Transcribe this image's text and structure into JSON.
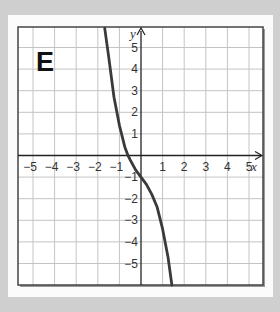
{
  "panel_label": "E",
  "chart_data": {
    "type": "line",
    "title": "E",
    "xlabel": "x",
    "ylabel": "y",
    "xlim": [
      -5.7,
      5.65
    ],
    "ylim": [
      -6,
      5.9
    ],
    "grid": true,
    "x_ticks": [
      "-5",
      "-4",
      "-3",
      "-2",
      "-1",
      "1",
      "2",
      "3",
      "4",
      "5"
    ],
    "y_ticks": [
      "5",
      "4",
      "3",
      "2",
      "1",
      "-1",
      "-2",
      "-3",
      "-4",
      "-5"
    ],
    "series": [
      {
        "name": "curve",
        "color": "#3a3a3a",
        "x": [
          -1.68,
          -1.5,
          -1.25,
          -1.0,
          -0.75,
          -0.6,
          -0.5,
          -0.25,
          0,
          0.25,
          0.5,
          0.75,
          1.0,
          1.25,
          1.43
        ],
        "y": [
          5.9,
          4.6,
          2.7,
          1.4,
          0.4,
          0.0,
          -0.2,
          -0.66,
          -1.0,
          -1.34,
          -1.8,
          -2.4,
          -3.4,
          -4.7,
          -6.0
        ]
      }
    ],
    "annotations": [
      "y-intercept at (0, -1)",
      "x-intercept near -0.6"
    ]
  }
}
